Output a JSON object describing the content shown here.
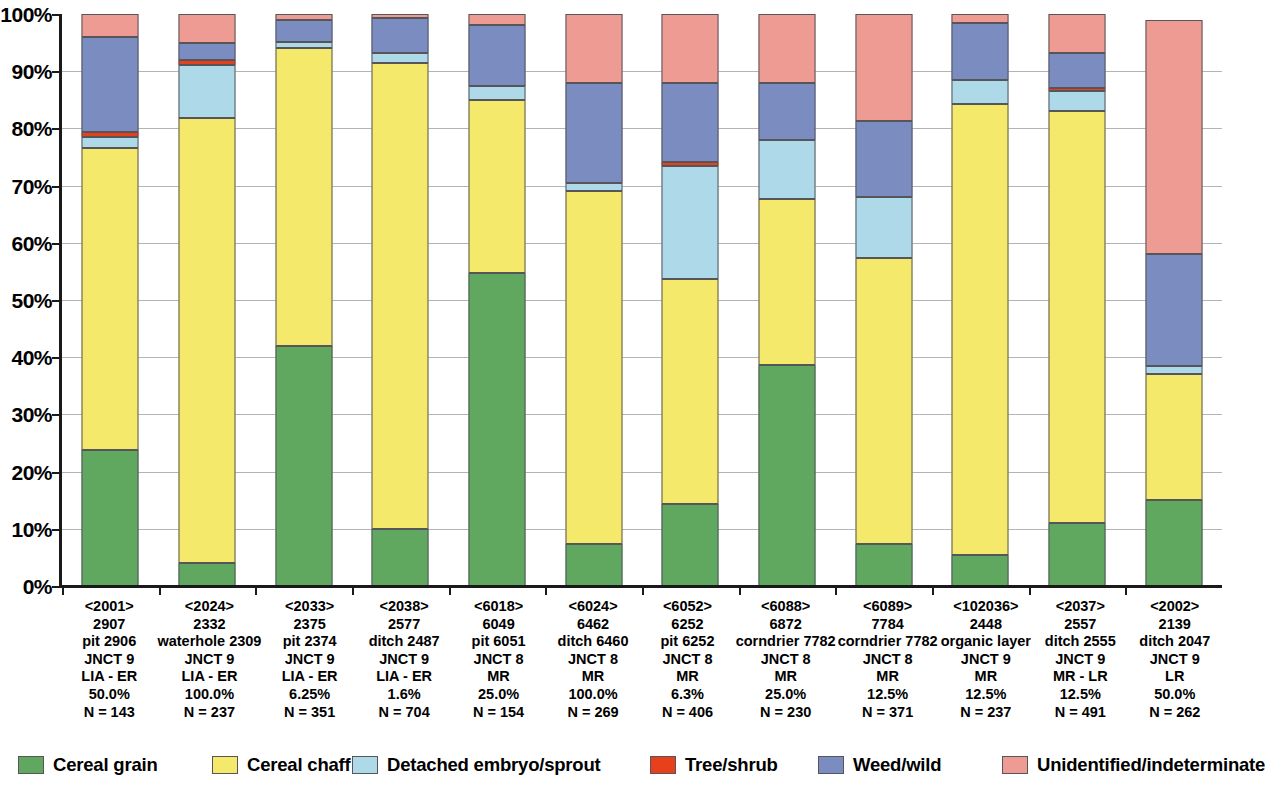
{
  "chart_data": {
    "type": "bar",
    "subtype": "stacked-percentage",
    "title": "",
    "xlabel": "",
    "ylabel": "",
    "ylim": [
      0,
      100
    ],
    "grid": true,
    "legend_position": "bottom",
    "y_ticks": [
      "0%",
      "10%",
      "20%",
      "30%",
      "40%",
      "50%",
      "60%",
      "70%",
      "80%",
      "90%",
      "100%"
    ],
    "y_tick_values": [
      0,
      10,
      20,
      30,
      40,
      50,
      60,
      70,
      80,
      90,
      100
    ],
    "series": [
      {
        "name": "Cereal grain",
        "color": "#60a860",
        "values": [
          23.8,
          4.0,
          42.0,
          9.9,
          54.7,
          7.4,
          14.4,
          38.6,
          7.4,
          5.5,
          11.0,
          15.0
        ]
      },
      {
        "name": "Cereal chaff",
        "color": "#f5e96b",
        "values": [
          52.7,
          77.9,
          52.0,
          81.6,
          30.3,
          61.6,
          39.3,
          29.1,
          49.9,
          78.7,
          72.0,
          22.0
        ]
      },
      {
        "name": "Detached embryo/sprout",
        "color": "#add9e8",
        "values": [
          2.0,
          9.2,
          1.1,
          1.6,
          2.5,
          1.5,
          19.8,
          10.3,
          10.7,
          4.3,
          3.5,
          1.5
        ]
      },
      {
        "name": "Tree/shrub",
        "color": "#e8401a",
        "values": [
          0.8,
          0.8,
          0.0,
          0.0,
          0.0,
          0.0,
          0.6,
          0.0,
          0.0,
          0.0,
          0.6,
          0.0
        ]
      },
      {
        "name": "Weed/wild",
        "color": "#7b8cc0",
        "values": [
          16.7,
          3.1,
          3.9,
          6.2,
          10.5,
          17.5,
          13.9,
          10.0,
          13.3,
          10.0,
          6.0,
          19.5
        ]
      },
      {
        "name": "Unidentified/indeterminate",
        "color": "#ee9c93",
        "values": [
          4.0,
          5.0,
          1.0,
          0.7,
          2.0,
          12.0,
          12.0,
          12.0,
          18.7,
          1.5,
          6.9,
          41.0
        ]
      }
    ],
    "categories": [
      {
        "sample": "<2001>",
        "context_number": "2907",
        "feature": "pit 2906",
        "site": "JNCT 9",
        "period": "LIA - ER",
        "fraction": "50.0%",
        "count": "N = 143"
      },
      {
        "sample": "<2024>",
        "context_number": "2332",
        "feature": "waterhole 2309",
        "site": "JNCT 9",
        "period": "LIA - ER",
        "fraction": "100.0%",
        "count": "N = 237"
      },
      {
        "sample": "<2033>",
        "context_number": "2375",
        "feature": "pit 2374",
        "site": "JNCT 9",
        "period": "LIA - ER",
        "fraction": "6.25%",
        "count": "N = 351"
      },
      {
        "sample": "<2038>",
        "context_number": "2577",
        "feature": "ditch 2487",
        "site": "JNCT 9",
        "period": "LIA - ER",
        "fraction": "1.6%",
        "count": "N = 704"
      },
      {
        "sample": "<6018>",
        "context_number": "6049",
        "feature": "pit 6051",
        "site": "JNCT 8",
        "period": "MR",
        "fraction": "25.0%",
        "count": "N = 154"
      },
      {
        "sample": "<6024>",
        "context_number": "6462",
        "feature": "ditch 6460",
        "site": "JNCT 8",
        "period": "MR",
        "fraction": "100.0%",
        "count": "N = 269"
      },
      {
        "sample": "<6052>",
        "context_number": "6252",
        "feature": "pit 6252",
        "site": "JNCT 8",
        "period": "MR",
        "fraction": "6.3%",
        "count": "N = 406"
      },
      {
        "sample": "<6088>",
        "context_number": "6872",
        "feature": "corndrier 7782",
        "site": "JNCT 8",
        "period": "MR",
        "fraction": "25.0%",
        "count": "N = 230"
      },
      {
        "sample": "<6089>",
        "context_number": "7784",
        "feature": "corndrier 7782",
        "site": "JNCT 8",
        "period": "MR",
        "fraction": "12.5%",
        "count": "N = 371"
      },
      {
        "sample": "<102036>",
        "context_number": "2448",
        "feature": "organic layer",
        "site": "JNCT 9",
        "period": "MR",
        "fraction": "12.5%",
        "count": "N = 237"
      },
      {
        "sample": "<2037>",
        "context_number": "2557",
        "feature": "ditch 2555",
        "site": "JNCT 9",
        "period": "MR - LR",
        "fraction": "12.5%",
        "count": "N = 491"
      },
      {
        "sample": "<2002>",
        "context_number": "2139",
        "feature": "ditch 2047",
        "site": "JNCT 9",
        "period": "LR",
        "fraction": "50.0%",
        "count": "N = 262"
      }
    ]
  }
}
